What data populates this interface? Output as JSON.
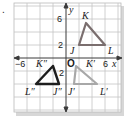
{
  "problem_marker": ".",
  "graph": {
    "x_axis_label": "x",
    "y_axis_label": "y",
    "origin_label": "O",
    "tick_labels": {
      "x_neg": "−6",
      "x_pos": "6",
      "y_top": "6",
      "y_mid": "2",
      "y_neg": "2",
      "x_small": "2",
      "x_small2": "2"
    },
    "grid_range": {
      "x": [
        -8,
        8
      ],
      "y": [
        -8,
        8
      ]
    },
    "grid_step": 2
  },
  "triangles": {
    "original": {
      "labels": {
        "J": "J",
        "K": "K",
        "L": "L"
      },
      "points": {
        "J": [
          2,
          2
        ],
        "K": [
          3,
          5
        ],
        "L": [
          6,
          2
        ]
      },
      "color": "#7a6e6e"
    },
    "prime": {
      "labels": {
        "J": "J′",
        "K": "K′",
        "L": "L′"
      },
      "points": {
        "J": [
          1.3,
          -4
        ],
        "K": [
          1.5,
          -1.2
        ],
        "L": [
          5,
          -4
        ]
      },
      "color": "#a8a8a8"
    },
    "double_prime": {
      "labels": {
        "J": "J″",
        "K": "K″",
        "L": "L″"
      },
      "points": {
        "J": [
          -1,
          -4
        ],
        "K": [
          -2,
          -1.2
        ],
        "L": [
          -5,
          -4
        ]
      },
      "color": "#1e1e1e"
    }
  }
}
